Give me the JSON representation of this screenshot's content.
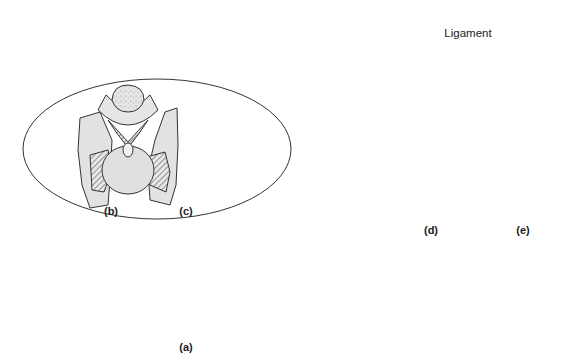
{
  "figure": {
    "type": "anatomical-illustration",
    "colors": {
      "background": "#ffffff",
      "outline": "#333333",
      "bone_fill": "#e2e2e2",
      "bone_shade": "#cfcfcf",
      "ligament_fill": "#d8d8d8",
      "hatch": "#555555"
    }
  },
  "panels": {
    "a": {
      "label": "(a)",
      "description": "Full skeleton in side view"
    },
    "b": {
      "label": "(b)",
      "description": "Vertebra, front view"
    },
    "c": {
      "label": "(c)",
      "description": "Vertebra, side view with ligament lines"
    },
    "d": {
      "label": "(d)",
      "description": "Vertebra, front view with ligament"
    },
    "e": {
      "label": "(e)",
      "description": "Vertebra, side view with ligament"
    }
  },
  "annotations": {
    "ligament": "Ligament"
  }
}
